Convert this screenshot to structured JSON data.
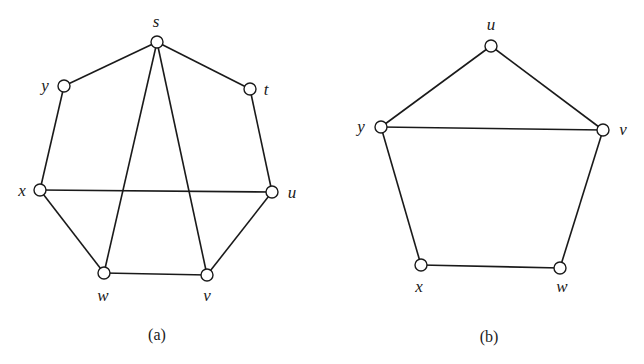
{
  "graphs": [
    {
      "id": "a",
      "caption": "(a)",
      "caption_pos": [
        157,
        340
      ],
      "nodes": [
        {
          "id": "s",
          "label": "s",
          "x": 157,
          "y": 42,
          "lx": 156,
          "ly": 27
        },
        {
          "id": "t",
          "label": "t",
          "x": 250,
          "y": 89,
          "lx": 266,
          "ly": 95
        },
        {
          "id": "u",
          "label": "u",
          "x": 272,
          "y": 192,
          "lx": 292,
          "ly": 198
        },
        {
          "id": "v",
          "label": "v",
          "x": 207,
          "y": 275,
          "lx": 207,
          "ly": 301
        },
        {
          "id": "w",
          "label": "w",
          "x": 104,
          "y": 273,
          "lx": 103,
          "ly": 301
        },
        {
          "id": "x",
          "label": "x",
          "x": 40,
          "y": 190,
          "lx": 22,
          "ly": 196
        },
        {
          "id": "y",
          "label": "y",
          "x": 64,
          "y": 86,
          "lx": 45,
          "ly": 91
        }
      ],
      "edges": [
        [
          "s",
          "y"
        ],
        [
          "s",
          "t"
        ],
        [
          "y",
          "x"
        ],
        [
          "t",
          "u"
        ],
        [
          "x",
          "u"
        ],
        [
          "x",
          "w"
        ],
        [
          "u",
          "v"
        ],
        [
          "w",
          "v"
        ],
        [
          "s",
          "w"
        ],
        [
          "s",
          "v"
        ]
      ]
    },
    {
      "id": "b",
      "caption": "(b)",
      "caption_pos": [
        489,
        342
      ],
      "nodes": [
        {
          "id": "u",
          "label": "u",
          "x": 491,
          "y": 46,
          "lx": 491,
          "ly": 30
        },
        {
          "id": "v",
          "label": "v",
          "x": 603,
          "y": 130,
          "lx": 623,
          "ly": 135
        },
        {
          "id": "w",
          "label": "w",
          "x": 560,
          "y": 268,
          "lx": 562,
          "ly": 292
        },
        {
          "id": "x",
          "label": "x",
          "x": 421,
          "y": 265,
          "lx": 419,
          "ly": 292
        },
        {
          "id": "y",
          "label": "y",
          "x": 381,
          "y": 127,
          "lx": 361,
          "ly": 132
        }
      ],
      "edges": [
        [
          "u",
          "y"
        ],
        [
          "u",
          "v"
        ],
        [
          "y",
          "v"
        ],
        [
          "y",
          "x"
        ],
        [
          "x",
          "w"
        ],
        [
          "w",
          "v"
        ]
      ]
    }
  ],
  "style": {
    "stroke_color": "#1a1a1a",
    "node_radius": 6,
    "background": "#ffffff"
  }
}
